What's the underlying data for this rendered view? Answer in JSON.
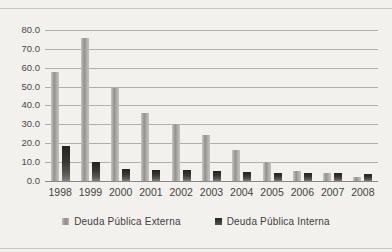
{
  "chart_data": {
    "type": "bar",
    "title": "",
    "categories": [
      "1998",
      "1999",
      "2000",
      "2001",
      "2002",
      "2003",
      "2004",
      "2005",
      "2006",
      "2007",
      "2008"
    ],
    "series": [
      {
        "name": "Deuda Pública Externa",
        "color": "#a5a3a0",
        "values": [
          58.0,
          75.5,
          49.5,
          36.0,
          30.0,
          24.5,
          16.5,
          10.0,
          5.5,
          4.0,
          2.0
        ]
      },
      {
        "name": "Deuda Pública Interna",
        "color": "#333230",
        "values": [
          18.5,
          10.0,
          6.5,
          6.0,
          6.0,
          5.5,
          5.0,
          4.0,
          4.5,
          4.5,
          3.5
        ]
      }
    ],
    "xlabel": "",
    "ylabel": "",
    "ylim": [
      0,
      80
    ],
    "ytick_step": 10,
    "ytick_labels": [
      "0.0",
      "10.0",
      "20.0",
      "30.0",
      "40.0",
      "50.0",
      "60.0",
      "70.0",
      "80.0"
    ],
    "grid": "horizontal",
    "legend_position": "bottom"
  },
  "colors": {
    "background": "#f2f1ee",
    "frame_border": "#c7c5c1",
    "gridline": "#b1afac",
    "axis_line": "#8a8886",
    "tick_text": "#4b4947",
    "legend_text": "#413f3d"
  }
}
